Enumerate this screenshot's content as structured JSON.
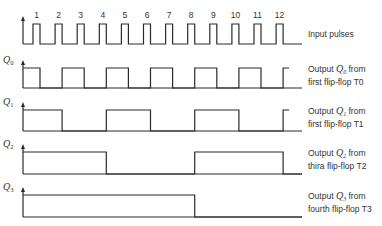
{
  "diagram": {
    "pulse_count": 12,
    "pulse_numbers": [
      "1",
      "2",
      "3",
      "4",
      "5",
      "6",
      "7",
      "8",
      "9",
      "10",
      "11",
      "12"
    ],
    "input_label": "Input pulses",
    "signals": [
      {
        "axis": "Q",
        "sub": "0",
        "label_line1_prefix": "Output ",
        "label_sym": "Q",
        "label_sub": "0",
        "label_line1_suffix": " from",
        "label_line2": "first flip-flop T0",
        "toggle_every": 1
      },
      {
        "axis": "Q",
        "sub": "1",
        "label_line1_prefix": "Output ",
        "label_sym": "Q",
        "label_sub": "1",
        "label_line1_suffix": " from",
        "label_line2": "first flip-flop T1",
        "toggle_every": 2
      },
      {
        "axis": "Q",
        "sub": "2",
        "label_line1_prefix": "Output ",
        "label_sym": "Q",
        "label_sub": "2",
        "label_line1_suffix": " from",
        "label_line2": "thira flip-flop T2",
        "toggle_every": 4
      },
      {
        "axis": "Q",
        "sub": "3",
        "label_line1_prefix": "Output ",
        "label_sym": "Q",
        "label_sub": "3",
        "label_line1_suffix": " from",
        "label_line2": "fourth flip-flop T3",
        "toggle_every": 8
      }
    ],
    "colors": {
      "line": "#2a2a2a",
      "baseline": "#444444",
      "background": "#ffffff"
    }
  }
}
